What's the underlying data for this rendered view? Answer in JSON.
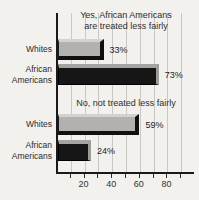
{
  "chart_data": {
    "type": "bar",
    "orientation": "horizontal",
    "value_suffix": "%",
    "xlim": [
      0,
      100
    ],
    "gridlines": [
      10,
      20,
      30,
      40,
      50,
      60,
      70,
      80,
      90
    ],
    "tick_labels": [
      20,
      40,
      60,
      80
    ],
    "legend": "none",
    "groups": [
      {
        "label": "Yes, African Americans are treated less fairly",
        "label_lines": [
          "Yes, African Americans",
          "are treated less fairly"
        ],
        "bars": [
          {
            "category": "Whites",
            "value": 33,
            "display": "33%",
            "color_key": "gray"
          },
          {
            "category": "African Americans",
            "value": 73,
            "display": "73%",
            "color_key": "black"
          }
        ]
      },
      {
        "label": "No, not treated less fairly",
        "label_lines": [
          "No, not treated less fairly"
        ],
        "bars": [
          {
            "category": "Whites",
            "value": 59,
            "display": "59%",
            "color_key": "gray"
          },
          {
            "category": "African Americans",
            "value": 24,
            "display": "24%",
            "color_key": "black"
          }
        ]
      }
    ],
    "colors": {
      "gray_bar": "#b2b1ae",
      "black_bar": "#161616",
      "background": "#f2f1ee",
      "gridline": "#c9c8c5",
      "axis": "#1a1a1a"
    }
  }
}
